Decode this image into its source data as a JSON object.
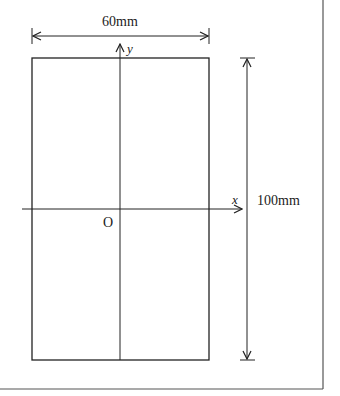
{
  "diagram": {
    "width_label": "60mm",
    "height_label": "100mm",
    "x_axis_label": "x",
    "y_axis_label": "y",
    "origin_label": "O",
    "stroke_color": "#222222",
    "frame_color": "#555555"
  }
}
